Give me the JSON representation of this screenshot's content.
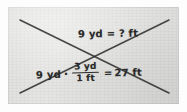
{
  "figure": {
    "background_color": "#e6e6e4",
    "ink_color": "#2a2a2a",
    "lines": [
      {
        "name": "line-descending",
        "x1": 20,
        "y1": 20,
        "x2": 169,
        "y2": 93
      },
      {
        "name": "line-ascending",
        "x1": 20,
        "y1": 93,
        "x2": 169,
        "y2": 20
      }
    ]
  },
  "top_equation": {
    "text": "9 yd = ? ft",
    "left_value": "9 yd",
    "equals": "=",
    "right_value": "? ft"
  },
  "bottom_equation": {
    "left_term": "9 yd",
    "operator": "·",
    "fraction": {
      "numerator": "3 yd",
      "denominator": "1 ft"
    },
    "equals": "=",
    "result": "27 ft"
  }
}
